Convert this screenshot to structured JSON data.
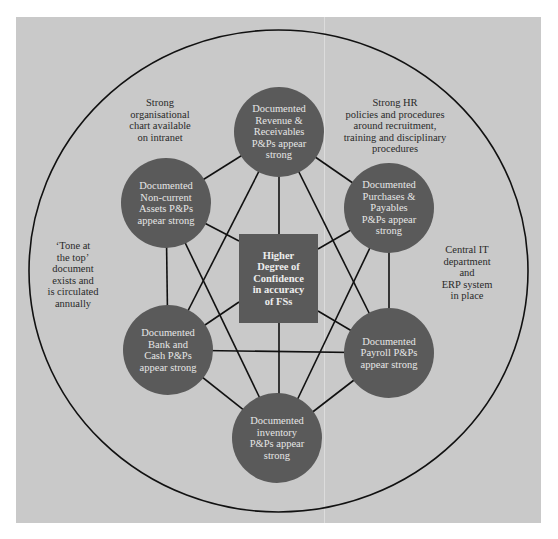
{
  "colors": {
    "background": "#c9c9c9",
    "node_fill": "#5a5a5a",
    "node_text": "#e6e6e6",
    "line": "#111111",
    "note_text": "#2a2a2a"
  },
  "center": {
    "label": "Higher\nDegree of\nConfidence\nin accuracy\nof FSs"
  },
  "nodes": [
    {
      "id": "revenue",
      "label": "Documented\nRevenue &\nReceivables\nP&Ps appear\nstrong"
    },
    {
      "id": "purchases",
      "label": "Documented\nPurchases &\nPayables\nP&Ps appear\nstrong"
    },
    {
      "id": "payroll",
      "label": "Documented\nPayroll P&Ps\nappear strong"
    },
    {
      "id": "inventory",
      "label": "Documented\ninventory\nP&Ps appear\nstrong"
    },
    {
      "id": "bank",
      "label": "Documented\nBank and\nCash P&Ps\nappear strong"
    },
    {
      "id": "noncurrent",
      "label": "Documented\nNon-current\nAssets P&Ps\nappear strong"
    }
  ],
  "notes": [
    {
      "id": "org-chart",
      "text": "Strong\norganisational\nchart available\non intranet"
    },
    {
      "id": "hr",
      "text": "Strong HR\npolicies and procedures\naround recruitment,\ntraining and disciplinary\nprocedures"
    },
    {
      "id": "tone",
      "text": "‘Tone at\nthe top’\ndocument\nexists and\nis circulated\nannually"
    },
    {
      "id": "it",
      "text": "Central IT\ndepartment\nand\nERP system\nin place"
    }
  ]
}
